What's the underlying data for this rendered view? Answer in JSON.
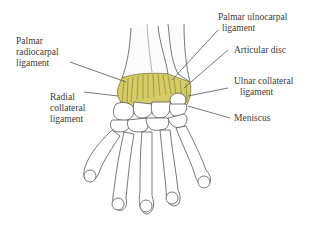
{
  "diagram": {
    "colors": {
      "bone_outline": "#555555",
      "bone_fill": "#ffffff",
      "ligament": "#cfc35a",
      "ligament_dark": "#6b6a2a",
      "leader_line": "#555555",
      "text": "#3c3c3c"
    },
    "labels": {
      "palmar_radiocarpal": {
        "line1": "Palmar",
        "line2": "radiocarpal",
        "line3": "ligament"
      },
      "radial_collateral": {
        "line1": "Radial",
        "line2": "collateral",
        "line3": "ligament"
      },
      "palmar_ulnocarpal": {
        "line1": "Palmar ulnocarpal",
        "line2": "ligament"
      },
      "articular_disc": {
        "line1": "Articular disc"
      },
      "ulnar_collateral": {
        "line1": "Ulnar collateral",
        "line2": "ligament"
      },
      "meniscus": {
        "line1": "Meniscus"
      }
    }
  }
}
